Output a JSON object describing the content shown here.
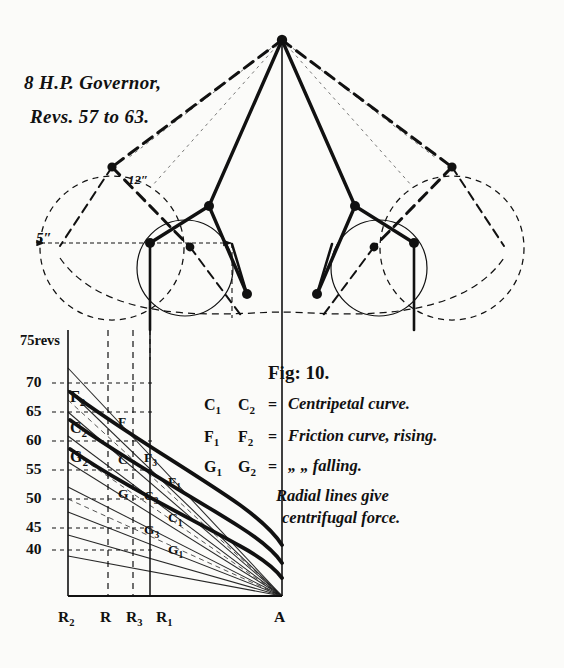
{
  "figure": {
    "title_line1": "8 H.P. Governor,",
    "title_line2": "Revs. 57 to 63.",
    "fig_number": "Fig: 10."
  },
  "legend": {
    "rows": [
      {
        "sym1": "C",
        "sub1": "1",
        "sym2": "C",
        "sub2": "2",
        "eq": "=",
        "text": "Centripetal curve."
      },
      {
        "sym1": "F",
        "sub1": "1",
        "sym2": "F",
        "sub2": "2",
        "eq": "=",
        "text": "Friction curve, rising."
      },
      {
        "sym1": "G",
        "sub1": "1",
        "sym2": "G",
        "sub2": "2",
        "eq": "=",
        "text": "„            „      falling."
      }
    ],
    "note_line1": "Radial lines give",
    "note_line2": "centrifugal force."
  },
  "dimensions": [
    {
      "name": "radius-5in",
      "label": "5″"
    },
    {
      "name": "radius-12in",
      "label": "12″"
    }
  ],
  "yaxis": {
    "top_label": "75revs",
    "ticks": [
      "70",
      "65",
      "60",
      "55",
      "50",
      "45",
      "40"
    ]
  },
  "xaxis": {
    "ticks": [
      {
        "sym": "R",
        "sub": "2"
      },
      {
        "sym": "R",
        "sub": ""
      },
      {
        "sym": "R",
        "sub": "3"
      },
      {
        "sym": "R",
        "sub": "1"
      }
    ],
    "apex": "A"
  },
  "curve_labels": {
    "left": [
      {
        "sym": "F",
        "sub": "2"
      },
      {
        "sym": "C",
        "sub": "2"
      },
      {
        "sym": "G",
        "sub": "2"
      }
    ],
    "mid": [
      {
        "sym": "F",
        "sub": ""
      },
      {
        "sym": "C",
        "sub": ""
      },
      {
        "sym": "G",
        "sub": ""
      }
    ],
    "mid2": [
      {
        "sym": "F",
        "sub": "3"
      },
      {
        "sym": "C",
        "sub": "3"
      },
      {
        "sym": "G",
        "sub": "3"
      }
    ],
    "right": [
      {
        "sym": "F",
        "sub": "1"
      },
      {
        "sym": "C",
        "sub": "1"
      },
      {
        "sym": "G",
        "sub": "1"
      }
    ]
  },
  "style": {
    "ink": "#111111",
    "paper": "#fbfbf9"
  }
}
